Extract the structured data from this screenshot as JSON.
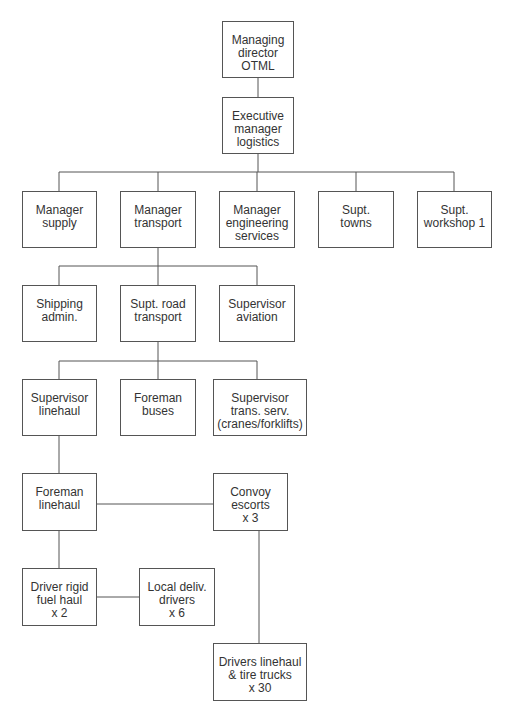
{
  "diagram": {
    "type": "org-chart",
    "line_color": "#555555",
    "text_color": "#333333",
    "nodes": [
      {
        "id": "managing-director",
        "label": "Managing\ndirector\nOTML",
        "x": 222,
        "y": 21,
        "w": 72,
        "h": 57
      },
      {
        "id": "executive-manager-logistics",
        "label": "Executive\nmanager\nlogistics",
        "x": 222,
        "y": 97,
        "w": 72,
        "h": 57
      },
      {
        "id": "manager-supply",
        "label": "Manager\nsupply",
        "x": 22,
        "y": 191,
        "w": 75,
        "h": 57
      },
      {
        "id": "manager-transport",
        "label": "Manager\ntransport",
        "x": 120,
        "y": 191,
        "w": 76,
        "h": 57
      },
      {
        "id": "manager-engineering-services",
        "label": "Manager\nengineering\nservices",
        "x": 219,
        "y": 191,
        "w": 76,
        "h": 57
      },
      {
        "id": "supt-towns",
        "label": "Supt.\ntowns",
        "x": 318,
        "y": 191,
        "w": 76,
        "h": 57
      },
      {
        "id": "supt-workshop-1",
        "label": "Supt.\nworkshop 1",
        "x": 417,
        "y": 191,
        "w": 75,
        "h": 57
      },
      {
        "id": "shipping-admin",
        "label": "Shipping\nadmin.",
        "x": 22,
        "y": 285,
        "w": 75,
        "h": 57
      },
      {
        "id": "supt-road-transport",
        "label": "Supt. road\ntransport",
        "x": 120,
        "y": 285,
        "w": 76,
        "h": 57
      },
      {
        "id": "supervisor-aviation",
        "label": "Supervisor\naviation",
        "x": 219,
        "y": 285,
        "w": 76,
        "h": 57
      },
      {
        "id": "supervisor-linehaul",
        "label": "Supervisor\nlinehaul",
        "x": 22,
        "y": 379,
        "w": 75,
        "h": 57
      },
      {
        "id": "foreman-buses",
        "label": "Foreman\nbuses",
        "x": 120,
        "y": 379,
        "w": 76,
        "h": 57
      },
      {
        "id": "supervisor-trans-serv",
        "label": "Supervisor\ntrans. serv.\n(cranes/forklifts)",
        "x": 213,
        "y": 379,
        "w": 94,
        "h": 57
      },
      {
        "id": "foreman-linehaul",
        "label": "Foreman\nlinehaul",
        "x": 22,
        "y": 473,
        "w": 75,
        "h": 58
      },
      {
        "id": "convoy-escorts",
        "label": "Convoy\nescorts\nx 3",
        "x": 213,
        "y": 473,
        "w": 75,
        "h": 58
      },
      {
        "id": "driver-rigid-fuel-haul",
        "label": "Driver rigid\nfuel haul\nx 2",
        "x": 22,
        "y": 568,
        "w": 75,
        "h": 58
      },
      {
        "id": "local-deliv-drivers",
        "label": "Local deliv.\ndrivers\nx 6",
        "x": 139,
        "y": 568,
        "w": 76,
        "h": 58
      },
      {
        "id": "drivers-linehaul-tire-trucks",
        "label": "Drivers linehaul\n& tire trucks\nx 30",
        "x": 213,
        "y": 643,
        "w": 94,
        "h": 58
      }
    ],
    "edges": [
      {
        "from": "managing-director",
        "to": "executive-manager-logistics"
      },
      {
        "from": "executive-manager-logistics",
        "to": "manager-supply"
      },
      {
        "from": "executive-manager-logistics",
        "to": "manager-transport"
      },
      {
        "from": "executive-manager-logistics",
        "to": "manager-engineering-services"
      },
      {
        "from": "executive-manager-logistics",
        "to": "supt-towns"
      },
      {
        "from": "executive-manager-logistics",
        "to": "supt-workshop-1"
      },
      {
        "from": "manager-transport",
        "to": "shipping-admin"
      },
      {
        "from": "manager-transport",
        "to": "supt-road-transport"
      },
      {
        "from": "manager-transport",
        "to": "supervisor-aviation"
      },
      {
        "from": "supt-road-transport",
        "to": "supervisor-linehaul"
      },
      {
        "from": "supt-road-transport",
        "to": "foreman-buses"
      },
      {
        "from": "supt-road-transport",
        "to": "supervisor-trans-serv"
      },
      {
        "from": "supervisor-linehaul",
        "to": "foreman-linehaul"
      },
      {
        "from": "foreman-linehaul",
        "to": "convoy-escorts"
      },
      {
        "from": "foreman-linehaul",
        "to": "driver-rigid-fuel-haul"
      },
      {
        "from": "driver-rigid-fuel-haul",
        "to": "local-deliv-drivers"
      },
      {
        "from": "convoy-escorts",
        "to": "drivers-linehaul-tire-trucks"
      }
    ]
  }
}
